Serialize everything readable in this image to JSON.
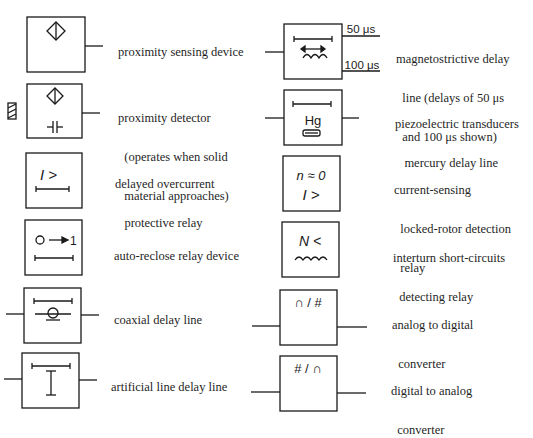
{
  "symbols": [
    {
      "id": "proximity-sensing-device",
      "label": [
        "proximity sensing device"
      ]
    },
    {
      "id": "proximity-detector",
      "label": [
        "proximity detector",
        "  (operates when solid",
        "  material approaches)"
      ]
    },
    {
      "id": "delayed-overcurrent-relay",
      "label": [
        "delayed overcurrent",
        "   protective relay"
      ],
      "glyph": "I >"
    },
    {
      "id": "auto-reclose-relay",
      "label": [
        "auto-reclose relay device"
      ],
      "glyph": "O → 1"
    },
    {
      "id": "coaxial-delay-line",
      "label": [
        "coaxial delay line"
      ]
    },
    {
      "id": "artificial-line-delay-line",
      "label": [
        "artificial line delay line"
      ],
      "glyph": "I"
    },
    {
      "id": "magnetostrictive-delay-line",
      "label": [
        "magnetostrictive delay",
        "  line (delays of 50 μs",
        "  and 100 μs shown)"
      ],
      "outputs": [
        "50 μs",
        "100 μs"
      ]
    },
    {
      "id": "mercury-delay-line",
      "label": [
        "piezoelectric transducers",
        "   mercury delay line"
      ],
      "glyph": "Hg"
    },
    {
      "id": "locked-rotor-relay",
      "label": [
        "current-sensing",
        "  locked-rotor detection",
        "  relay"
      ],
      "glyph": [
        "n ≈ 0",
        "I >"
      ]
    },
    {
      "id": "interturn-short-circuit-relay",
      "label": [
        "interturn short-circuits",
        "  detecting relay"
      ],
      "glyph": "N <"
    },
    {
      "id": "adc",
      "label": [
        "analog to digital",
        "  converter"
      ],
      "glyph": "∩ / #"
    },
    {
      "id": "dac",
      "label": [
        "digital to analog",
        "  converter"
      ],
      "glyph": "# / ∩"
    }
  ]
}
